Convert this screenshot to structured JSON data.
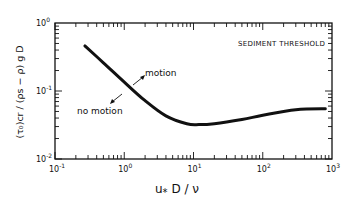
{
  "chart_data": {
    "type": "line",
    "title": "SEDIMENT THRESHOLD",
    "xlabel": "u* D / ν",
    "ylabel": "(τ0)cr / (ρs − ρ) g D",
    "xscale": "log",
    "yscale": "log",
    "xlim": [
      0.1,
      1000
    ],
    "ylim": [
      0.01,
      1
    ],
    "x_tick_labels": [
      "10^-1",
      "10^0",
      "10^1",
      "10^2",
      "10^3"
    ],
    "y_tick_labels": [
      "10^-2",
      "10^-1",
      "10^0"
    ],
    "grid": false,
    "legend": "none",
    "series": [
      {
        "name": "Shields threshold curve",
        "x": [
          0.27,
          0.5,
          1.0,
          2.0,
          4.0,
          8.0,
          12.0,
          20.0,
          50.0,
          100.0,
          300.0,
          800.0
        ],
        "y": [
          0.46,
          0.26,
          0.135,
          0.072,
          0.043,
          0.033,
          0.032,
          0.033,
          0.038,
          0.044,
          0.053,
          0.055
        ]
      }
    ],
    "annotations": [
      {
        "text": "motion",
        "region": "above curve",
        "arrow": "up-right"
      },
      {
        "text": "no motion",
        "region": "below curve",
        "arrow": "down-left"
      },
      {
        "text": "SEDIMENT THRESHOLD",
        "position": "top-right inside plot"
      }
    ]
  },
  "labels": {
    "title": "SEDIMENT THRESHOLD",
    "motion": "motion",
    "no_motion": "no motion",
    "x_axis": "u",
    "x_axis_sub": "*",
    "x_axis_rest": " D / ν",
    "y_axis": "(τ₀)cr / (ρs − ρ) g D",
    "x_ticks": [
      "10",
      "10",
      "10",
      "10",
      "10"
    ],
    "x_exps": [
      "-1",
      "0",
      "1",
      "2",
      "3"
    ],
    "y_ticks": [
      "10",
      "10",
      "10"
    ],
    "y_exps": [
      "0",
      "-1",
      "-2"
    ]
  }
}
